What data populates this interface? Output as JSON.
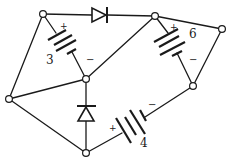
{
  "diagram": {
    "type": "circuit",
    "colors": {
      "ink": "#1a1a1a",
      "background": "#ffffff"
    },
    "nodes": [
      {
        "id": "A",
        "x": 43,
        "y": 14
      },
      {
        "id": "B",
        "x": 155,
        "y": 16
      },
      {
        "id": "C",
        "x": 222,
        "y": 29
      },
      {
        "id": "D",
        "x": 86,
        "y": 79
      },
      {
        "id": "E",
        "x": 9,
        "y": 99
      },
      {
        "id": "F",
        "x": 193,
        "y": 86
      },
      {
        "id": "G",
        "x": 86,
        "y": 153
      }
    ],
    "wires": [
      {
        "from": "A",
        "to": "E"
      },
      {
        "from": "E",
        "to": "D"
      },
      {
        "from": "E",
        "to": "G"
      },
      {
        "from": "D",
        "to": "B"
      },
      {
        "from": "B",
        "to": "C"
      },
      {
        "from": "C",
        "to": "F"
      }
    ],
    "batteries": [
      {
        "id": "battery-3",
        "label": "3",
        "from": "A",
        "to": "D",
        "plus": "+",
        "minus": "-"
      },
      {
        "id": "battery-6",
        "label": "6",
        "from": "B",
        "to": "F",
        "plus": "+",
        "minus": "-"
      },
      {
        "id": "battery-4",
        "label": "4",
        "from": "G",
        "to": "F",
        "plus": "+",
        "minus": "-"
      }
    ],
    "diodes": [
      {
        "id": "diode-top",
        "from": "A",
        "to": "B",
        "direction": "right"
      },
      {
        "id": "diode-center",
        "from": "G",
        "to": "D",
        "direction": "up"
      }
    ],
    "labels": {
      "battery_3": "3",
      "battery_6": "6",
      "battery_4": "4",
      "plus": "+",
      "minus": "−"
    }
  }
}
